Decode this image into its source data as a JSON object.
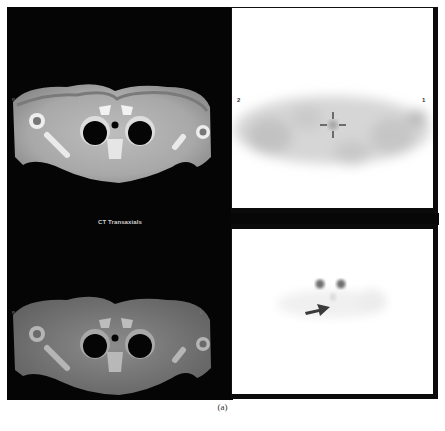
{
  "figure": {
    "caption": "(a)",
    "panels": {
      "ct_top": {
        "modality": "CT",
        "view": "transaxial",
        "left_marker": "R",
        "right_marker": "L"
      },
      "ct_label": "CT Transaxials",
      "ct_bottom": {
        "modality": "CT (fused)",
        "view": "transaxial",
        "left_marker": "R",
        "right_marker": "L"
      },
      "pet_top": {
        "modality": "PET",
        "view": "transaxial",
        "left_marker": "2",
        "right_marker": "1",
        "crosshair": true
      },
      "pet_bottom": {
        "modality": "PET",
        "view": "transaxial",
        "annotation": "arrow pointing to focal uptake"
      }
    },
    "colors": {
      "ct_background": "#050505",
      "pet_background": "#ffffff",
      "frame": "#0b0b0b"
    }
  }
}
